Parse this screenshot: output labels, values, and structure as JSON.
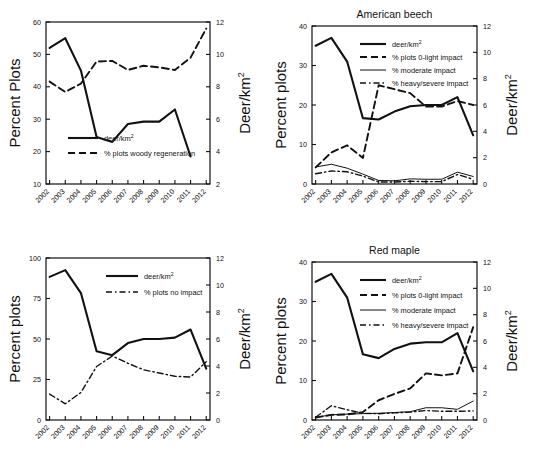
{
  "figure": {
    "name": "deer-density-and-browse-impact-panels",
    "panel_count": 4
  },
  "common": {
    "years": [
      "2002",
      "2003",
      "2004",
      "2005",
      "2006",
      "2007",
      "2008",
      "2009",
      "2010",
      "2011",
      "2012"
    ],
    "left_axis_title_caps": "Percent Plots",
    "left_axis_title": "Percent plots",
    "right_axis_title": "Deer/km",
    "right_axis_exponent": "2",
    "deer_legend": "deer/km",
    "deer_legend_exponent": "2"
  },
  "panels": [
    {
      "id": "top-left",
      "title": "",
      "left_ticks": [
        "10",
        "20",
        "30",
        "40",
        "50",
        "60"
      ],
      "right_ticks": [
        "2",
        "4",
        "6",
        "8",
        "10",
        "12"
      ],
      "legend": [
        {
          "label": "deer/km",
          "exponent": "2",
          "style": "solid"
        },
        {
          "label": "% plots woody regeneration",
          "exponent": "",
          "style": "dashed"
        }
      ]
    },
    {
      "id": "top-right",
      "title": "American beech",
      "left_ticks": [
        "0",
        "10",
        "20",
        "30",
        "40"
      ],
      "right_ticks": [
        "0",
        "2",
        "4",
        "6",
        "8",
        "10",
        "12"
      ],
      "legend": [
        {
          "label": "deer/km",
          "exponent": "2",
          "style": "solid"
        },
        {
          "label": "% plots 0-light impact",
          "exponent": "",
          "style": "dashed"
        },
        {
          "label": "% moderate impact",
          "exponent": "",
          "style": "thin"
        },
        {
          "label": "% heavy/severe impact",
          "exponent": "",
          "style": "dashdot"
        }
      ]
    },
    {
      "id": "bottom-left",
      "title": "",
      "left_ticks": [
        "0",
        "25",
        "50",
        "75",
        "100"
      ],
      "right_ticks": [
        "0",
        "2",
        "4",
        "6",
        "8",
        "10",
        "12"
      ],
      "legend": [
        {
          "label": "deer/km",
          "exponent": "2",
          "style": "solid"
        },
        {
          "label": "% plots no impact",
          "exponent": "",
          "style": "dashdot"
        }
      ]
    },
    {
      "id": "bottom-right",
      "title": "Red maple",
      "left_ticks": [
        "0",
        "10",
        "20",
        "30",
        "40"
      ],
      "right_ticks": [
        "0",
        "2",
        "4",
        "6",
        "8",
        "10",
        "12"
      ],
      "legend": [
        {
          "label": "deer/km",
          "exponent": "2",
          "style": "solid"
        },
        {
          "label": "% plots 0-light impact",
          "exponent": "",
          "style": "dashed"
        },
        {
          "label": "% moderate impact",
          "exponent": "",
          "style": "thin"
        },
        {
          "label": "% heavy/severe impact",
          "exponent": "",
          "style": "dashdot"
        }
      ]
    }
  ],
  "chart_data": [
    {
      "type": "line",
      "panel": "top-left",
      "title": "",
      "xlabel": "",
      "ylabel": "Percent Plots",
      "y2label": "Deer/km2",
      "x": [
        "2002",
        "2003",
        "2004",
        "2005",
        "2006",
        "2007",
        "2008",
        "2009",
        "2010",
        "2011",
        "2012"
      ],
      "ylim": [
        10,
        60
      ],
      "y2lim": [
        2,
        12
      ],
      "grid": false,
      "legend_position": "bottom-left-inside",
      "series": [
        {
          "name": "deer/km2",
          "axis": "right",
          "style": "solid",
          "values": [
            10.4,
            11.0,
            9.0,
            4.9,
            4.6,
            5.7,
            5.85,
            5.85,
            6.6,
            3.7,
            null
          ],
          "values_left_scale": [
            52.0,
            54.8,
            45.0,
            24.6,
            23.2,
            28.4,
            29.2,
            29.2,
            33.0,
            18.5,
            null
          ],
          "note": "plotted 2002-2011 with final drop at 2012 position"
        },
        {
          "name": "% plots woody regeneration",
          "axis": "left",
          "style": "dashed",
          "values": [
            41.6,
            38.4,
            41.0,
            47.8,
            48.0,
            45.2,
            46.5,
            46.0,
            45.2,
            49.0,
            58.0
          ]
        }
      ]
    },
    {
      "type": "line",
      "panel": "top-right",
      "title": "American beech",
      "xlabel": "",
      "ylabel": "Percent plots",
      "y2label": "Deer/km2",
      "x": [
        "2002",
        "2003",
        "2004",
        "2005",
        "2006",
        "2007",
        "2008",
        "2009",
        "2010",
        "2011",
        "2012"
      ],
      "ylim": [
        0,
        40
      ],
      "y2lim": [
        0,
        12
      ],
      "grid": false,
      "legend_position": "top-center-inside",
      "series": [
        {
          "name": "deer/km2",
          "axis": "right",
          "style": "solid",
          "values": [
            10.5,
            11.1,
            9.3,
            5.0,
            4.9,
            5.5,
            5.9,
            6.0,
            6.0,
            6.6,
            3.7
          ],
          "values_left_scale": [
            35.0,
            37.0,
            31.0,
            16.7,
            16.3,
            18.3,
            19.6,
            20.0,
            20.0,
            22.0,
            12.3
          ]
        },
        {
          "name": "% plots 0-light impact",
          "axis": "left",
          "style": "dashed",
          "values": [
            4.2,
            8.0,
            9.8,
            6.6,
            25.0,
            24.0,
            23.0,
            19.6,
            19.6,
            21.0,
            20.0
          ]
        },
        {
          "name": "% moderate impact",
          "axis": "left",
          "style": "thin",
          "values": [
            4.3,
            5.0,
            4.0,
            2.5,
            0.9,
            0.8,
            1.3,
            1.2,
            1.2,
            3.0,
            1.9
          ]
        },
        {
          "name": "% heavy/severe impact",
          "axis": "left",
          "style": "dashdot",
          "values": [
            2.6,
            3.3,
            3.1,
            2.0,
            0.5,
            0.5,
            0.7,
            0.6,
            0.6,
            2.4,
            1.2
          ]
        }
      ]
    },
    {
      "type": "line",
      "panel": "bottom-left",
      "title": "",
      "xlabel": "",
      "ylabel": "Percent plots",
      "y2label": "Deer/km2",
      "x": [
        "2002",
        "2003",
        "2004",
        "2005",
        "2006",
        "2007",
        "2008",
        "2009",
        "2010",
        "2011",
        "2012"
      ],
      "ylim": [
        0,
        100
      ],
      "y2lim": [
        0,
        12
      ],
      "grid": false,
      "legend_position": "top-center-inside",
      "series": [
        {
          "name": "deer/km2",
          "axis": "right",
          "style": "solid",
          "values": [
            10.6,
            11.1,
            9.4,
            5.1,
            4.8,
            5.7,
            6.0,
            6.0,
            6.1,
            6.7,
            3.8
          ],
          "values_left_scale": [
            88.0,
            92.5,
            78.0,
            42.5,
            40.0,
            47.5,
            50.0,
            50.0,
            50.5,
            55.5,
            31.5
          ]
        },
        {
          "name": "% plots no impact",
          "axis": "left",
          "style": "dashdot",
          "values": [
            16.0,
            10.0,
            17.0,
            33.0,
            39.5,
            35.0,
            31.0,
            29.0,
            27.0,
            26.5,
            36.0
          ]
        }
      ]
    },
    {
      "type": "line",
      "panel": "bottom-right",
      "title": "Red maple",
      "xlabel": "",
      "ylabel": "Percent plots",
      "y2label": "Deer/km2",
      "x": [
        "2002",
        "2003",
        "2004",
        "2005",
        "2006",
        "2007",
        "2008",
        "2009",
        "2010",
        "2011",
        "2012"
      ],
      "ylim": [
        0,
        40
      ],
      "y2lim": [
        0,
        12
      ],
      "grid": false,
      "legend_position": "top-center-inside",
      "series": [
        {
          "name": "deer/km2",
          "axis": "right",
          "style": "solid",
          "values": [
            10.5,
            11.1,
            9.3,
            5.0,
            4.7,
            5.4,
            5.8,
            5.9,
            5.9,
            6.6,
            3.7
          ],
          "values_left_scale": [
            35.0,
            37.0,
            31.0,
            16.7,
            15.6,
            18.0,
            19.3,
            19.7,
            19.7,
            22.0,
            12.3
          ]
        },
        {
          "name": "% plots 0-light impact",
          "axis": "left",
          "style": "dashed",
          "values": [
            0.6,
            1.3,
            1.4,
            2.0,
            5.0,
            6.6,
            8.0,
            11.8,
            11.3,
            11.8,
            23.5
          ]
        },
        {
          "name": "% moderate impact",
          "axis": "left",
          "style": "thin",
          "values": [
            0.7,
            1.3,
            1.5,
            1.6,
            1.7,
            1.9,
            2.1,
            3.1,
            3.1,
            2.7,
            4.8
          ]
        },
        {
          "name": "% heavy/severe impact",
          "axis": "left",
          "style": "dashdot",
          "values": [
            0.7,
            3.6,
            2.6,
            1.7,
            1.6,
            1.8,
            2.0,
            2.4,
            2.2,
            2.2,
            2.3
          ]
        }
      ]
    }
  ]
}
